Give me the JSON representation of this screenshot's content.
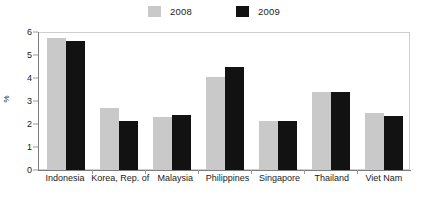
{
  "legend": {
    "position": "top-center",
    "entries": [
      {
        "label": "2008",
        "color": "#c9c9c9",
        "swatch_name": "legend-swatch-2008"
      },
      {
        "label": "2009",
        "color": "#121212",
        "swatch_name": "legend-swatch-2009"
      }
    ]
  },
  "axes": {
    "y_title": "%",
    "y_ticks": [
      "0",
      "1",
      "2",
      "3",
      "4",
      "5",
      "6"
    ],
    "y_min": 0,
    "y_max": 6,
    "y_step": 1,
    "grid": false
  },
  "chart_data": {
    "type": "bar",
    "title": "",
    "subtitle": "",
    "xlabel": "",
    "ylabel": "%",
    "ylim": [
      0,
      6
    ],
    "ytick_step": 1,
    "grid": false,
    "legend_position": "top-center",
    "categories": [
      "Indonesia",
      "Korea, Rep. of",
      "Malaysia",
      "Philippines",
      "Singapore",
      "Thailand",
      "Viet Nam"
    ],
    "series": [
      {
        "name": "2008",
        "color": "#c9c9c9",
        "values": [
          5.75,
          2.7,
          2.3,
          4.05,
          2.15,
          3.4,
          2.5
        ]
      },
      {
        "name": "2009",
        "color": "#121212",
        "values": [
          5.6,
          2.15,
          2.4,
          4.5,
          2.15,
          3.4,
          2.35
        ]
      }
    ]
  }
}
